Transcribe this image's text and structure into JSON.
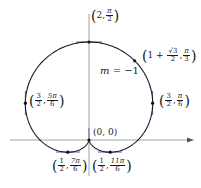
{
  "diagram": {
    "curve": "r = 1 + sin(theta)",
    "origin_label": "(0, 0)",
    "slope_label": {
      "var": "m",
      "eq": "= −1"
    },
    "points": [
      {
        "id": "top",
        "r": "2",
        "theta_num": "π",
        "theta_den": "2"
      },
      {
        "id": "pi3",
        "r_prefix": "1 + ",
        "r_num": "√3",
        "r_den": "2",
        "theta_num": "π",
        "theta_den": "3"
      },
      {
        "id": "pi6",
        "r_num": "3",
        "r_den": "2",
        "theta_num": "π",
        "theta_den": "6"
      },
      {
        "id": "5pi6",
        "r_num": "3",
        "r_den": "2",
        "theta_num": "5π",
        "theta_den": "6"
      },
      {
        "id": "7pi6",
        "r_num": "1",
        "r_den": "2",
        "theta_num": "7π",
        "theta_den": "6"
      },
      {
        "id": "11pi6",
        "r_num": "1",
        "r_den": "2",
        "theta_num": "11π",
        "theta_den": "6"
      }
    ],
    "colors": {
      "curve": "#1a1a2a",
      "axis": "#888888",
      "tangent": "#4a6fa8"
    }
  }
}
